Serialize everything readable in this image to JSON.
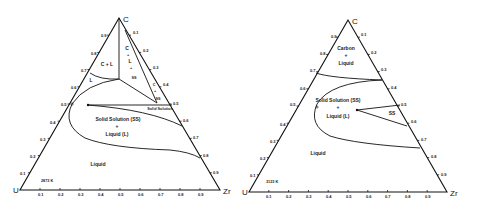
{
  "diagrams": [
    {
      "id": "left",
      "temperature": "2873 K",
      "vertices": {
        "top": "C",
        "left": "U",
        "right": "Zr"
      },
      "regions": {
        "c_plus_l": "C + L",
        "l": "L",
        "c_l_ss_1": "C",
        "c_l_ss_2": "+",
        "c_l_ss_3": "L",
        "c_l_ss_4": "+",
        "c_l_ss_5": "SS",
        "c_ss_1": "C",
        "c_ss_2": "+",
        "c_ss_3": "SS",
        "solid_solution": "Solid Solution",
        "ss_l_1": "Solid Solution (SS)",
        "ss_l_2": "+",
        "ss_l_3": "Liquid (L)",
        "liquid": "Liquid"
      },
      "left_axis_ticks": [
        "0.1",
        "0.2",
        "0.3",
        "0.4",
        "0.5",
        "0.6",
        "0.7",
        "0.8",
        "0.9"
      ],
      "right_axis_ticks": [
        "0.1",
        "0.2",
        "0.3",
        "0.4",
        "0.5",
        "0.6",
        "0.7",
        "0.8",
        "0.9"
      ],
      "bottom_axis_ticks": [
        "0.1",
        "0.2",
        "0.3",
        "0.4",
        "0.5",
        "0.6",
        "0.7",
        "0.8",
        "0.9"
      ]
    },
    {
      "id": "right",
      "temperature": "3123 K",
      "vertices": {
        "top": "C",
        "left": "U",
        "right": "Zr"
      },
      "regions": {
        "carbon_liquid_1": "Carbon",
        "carbon_liquid_2": "+",
        "carbon_liquid_3": "Liquid",
        "ss_l_1": "Solid Solution (SS)",
        "ss_l_2": "+",
        "ss_l_3": "Liquid (L)",
        "ss": "SS",
        "liquid": "Liquid"
      },
      "left_axis_ticks": [
        "0.1",
        "0.2",
        "0.3",
        "0.4",
        "0.5",
        "0.6",
        "0.7",
        "0.8",
        "0.9"
      ],
      "right_axis_ticks": [
        "0.1",
        "0.2",
        "0.3",
        "0.4",
        "0.5",
        "0.6",
        "0.7",
        "0.8",
        "0.9"
      ],
      "bottom_axis_ticks": [
        "0.1",
        "0.2",
        "0.3",
        "0.4",
        "0.5",
        "0.6",
        "0.7",
        "0.8",
        "0.9"
      ]
    }
  ]
}
